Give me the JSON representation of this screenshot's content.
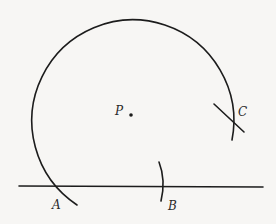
{
  "figure": {
    "points": {
      "P": {
        "label": "P"
      },
      "A": {
        "label": "A"
      },
      "B": {
        "label": "B"
      },
      "C": {
        "label": "C"
      }
    },
    "colors": {
      "ink": "#1c1c1c",
      "paper": "#f7f6f4"
    }
  }
}
